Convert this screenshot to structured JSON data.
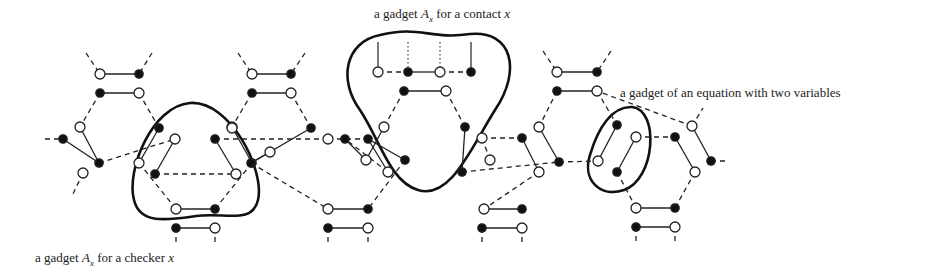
{
  "labels": {
    "contact": {
      "prefix": "a gadget ",
      "sym": "A",
      "sub": "x",
      "mid": " for a contact ",
      "var": "x",
      "x": 374,
      "y": 6
    },
    "equation": {
      "text": "a gadget of an equation with two variables",
      "x": 620,
      "y": 85
    },
    "checker": {
      "prefix": "a gadget ",
      "sym": "A",
      "sub": "x",
      "mid": " for a checker ",
      "var": "x",
      "x": 35,
      "y": 250
    }
  },
  "colors": {
    "stroke": "#222222",
    "node_fill_dark": "#111111",
    "node_fill_light": "#ffffff",
    "loop": "#111111"
  },
  "nodes": [
    {
      "id": "a1",
      "x": 100,
      "y": 74,
      "f": 0
    },
    {
      "id": "a2",
      "x": 139,
      "y": 74,
      "f": 1
    },
    {
      "id": "a3",
      "x": 100,
      "y": 93,
      "f": 1
    },
    {
      "id": "a4",
      "x": 139,
      "y": 93,
      "f": 0
    },
    {
      "id": "b1",
      "x": 252,
      "y": 74,
      "f": 0
    },
    {
      "id": "b2",
      "x": 291,
      "y": 74,
      "f": 1
    },
    {
      "id": "b3",
      "x": 252,
      "y": 93,
      "f": 1
    },
    {
      "id": "b4",
      "x": 291,
      "y": 93,
      "f": 0
    },
    {
      "id": "e1",
      "x": 557,
      "y": 72,
      "f": 0
    },
    {
      "id": "e2",
      "x": 597,
      "y": 72,
      "f": 1
    },
    {
      "id": "e3",
      "x": 557,
      "y": 91,
      "f": 1
    },
    {
      "id": "e4",
      "x": 597,
      "y": 91,
      "f": 0
    },
    {
      "id": "L1",
      "x": 63,
      "y": 139,
      "f": 1
    },
    {
      "id": "L2",
      "x": 80,
      "y": 127,
      "f": 0
    },
    {
      "id": "L3",
      "x": 99,
      "y": 163,
      "f": 1
    },
    {
      "id": "L4",
      "x": 83,
      "y": 173,
      "f": 0
    },
    {
      "id": "c1",
      "x": 159,
      "y": 128,
      "f": 1
    },
    {
      "id": "c2",
      "x": 175,
      "y": 139,
      "f": 0
    },
    {
      "id": "c3",
      "x": 215,
      "y": 139,
      "f": 1
    },
    {
      "id": "c4",
      "x": 232,
      "y": 127,
      "f": 0
    },
    {
      "id": "c5",
      "x": 139,
      "y": 163,
      "f": 0
    },
    {
      "id": "c6",
      "x": 155,
      "y": 174,
      "f": 1
    },
    {
      "id": "c7",
      "x": 236,
      "y": 174,
      "f": 0
    },
    {
      "id": "c8",
      "x": 252,
      "y": 163,
      "f": 1
    },
    {
      "id": "c9",
      "x": 176,
      "y": 209,
      "f": 0
    },
    {
      "id": "c10",
      "x": 215,
      "y": 209,
      "f": 1
    },
    {
      "id": "c11",
      "x": 176,
      "y": 228,
      "f": 1
    },
    {
      "id": "c12",
      "x": 215,
      "y": 228,
      "f": 0
    },
    {
      "id": "d1",
      "x": 232,
      "y": 128,
      "f": 0
    },
    {
      "id": "d2",
      "x": 311,
      "y": 128,
      "f": 1
    },
    {
      "id": "d3",
      "x": 328,
      "y": 139,
      "f": 0
    },
    {
      "id": "d4",
      "x": 368,
      "y": 139,
      "f": 1
    },
    {
      "id": "d5",
      "x": 251,
      "y": 163,
      "f": 1
    },
    {
      "id": "d6",
      "x": 270,
      "y": 152,
      "f": 0
    },
    {
      "id": "d7",
      "x": 405,
      "y": 160,
      "f": 1
    },
    {
      "id": "d8",
      "x": 388,
      "y": 172,
      "f": 0
    },
    {
      "id": "d9",
      "x": 328,
      "y": 209,
      "f": 0
    },
    {
      "id": "d10",
      "x": 368,
      "y": 209,
      "f": 1
    },
    {
      "id": "d11",
      "x": 328,
      "y": 228,
      "f": 1
    },
    {
      "id": "d12",
      "x": 368,
      "y": 228,
      "f": 0
    },
    {
      "id": "g1",
      "x": 378,
      "y": 72,
      "f": 0
    },
    {
      "id": "g2",
      "x": 408,
      "y": 72,
      "f": 1
    },
    {
      "id": "g3",
      "x": 440,
      "y": 72,
      "f": 0
    },
    {
      "id": "g4",
      "x": 471,
      "y": 72,
      "f": 1
    },
    {
      "id": "g5",
      "x": 404,
      "y": 91,
      "f": 1
    },
    {
      "id": "g6",
      "x": 446,
      "y": 91,
      "f": 0
    },
    {
      "id": "g7",
      "x": 384,
      "y": 127,
      "f": 0
    },
    {
      "id": "g8",
      "x": 465,
      "y": 127,
      "f": 1
    },
    {
      "id": "g9",
      "x": 345,
      "y": 139,
      "f": 1
    },
    {
      "id": "g10",
      "x": 366,
      "y": 160,
      "f": 0
    },
    {
      "id": "g11",
      "x": 490,
      "y": 160,
      "f": 0
    },
    {
      "id": "g12",
      "x": 462,
      "y": 172,
      "f": 1
    },
    {
      "id": "h1",
      "x": 482,
      "y": 138,
      "f": 0
    },
    {
      "id": "h2",
      "x": 522,
      "y": 138,
      "f": 1
    },
    {
      "id": "h3",
      "x": 539,
      "y": 127,
      "f": 0
    },
    {
      "id": "h4",
      "x": 559,
      "y": 162,
      "f": 1
    },
    {
      "id": "h5",
      "x": 539,
      "y": 172,
      "f": 0
    },
    {
      "id": "h6",
      "x": 484,
      "y": 209,
      "f": 0
    },
    {
      "id": "h7",
      "x": 522,
      "y": 209,
      "f": 1
    },
    {
      "id": "h8",
      "x": 482,
      "y": 228,
      "f": 1
    },
    {
      "id": "h9",
      "x": 522,
      "y": 228,
      "f": 0
    },
    {
      "id": "q1",
      "x": 617,
      "y": 125,
      "f": 1
    },
    {
      "id": "q2",
      "x": 636,
      "y": 137,
      "f": 0
    },
    {
      "id": "q3",
      "x": 598,
      "y": 161,
      "f": 0
    },
    {
      "id": "q4",
      "x": 617,
      "y": 172,
      "f": 1
    },
    {
      "id": "r1",
      "x": 675,
      "y": 137,
      "f": 1
    },
    {
      "id": "r2",
      "x": 692,
      "y": 126,
      "f": 0
    },
    {
      "id": "r3",
      "x": 711,
      "y": 161,
      "f": 1
    },
    {
      "id": "r4",
      "x": 695,
      "y": 172,
      "f": 0
    },
    {
      "id": "r5",
      "x": 636,
      "y": 208,
      "f": 0
    },
    {
      "id": "r6",
      "x": 675,
      "y": 208,
      "f": 1
    },
    {
      "id": "r7",
      "x": 636,
      "y": 227,
      "f": 1
    },
    {
      "id": "r8",
      "x": 675,
      "y": 227,
      "f": 0
    }
  ],
  "solid_edges": [
    [
      "a1",
      "a2"
    ],
    [
      "a3",
      "a4"
    ],
    [
      "b1",
      "b2"
    ],
    [
      "b3",
      "b4"
    ],
    [
      "e1",
      "e2"
    ],
    [
      "e3",
      "e4"
    ],
    [
      "L1",
      "L3"
    ],
    [
      "L2",
      "L3"
    ],
    [
      "c1",
      "c5"
    ],
    [
      "c2",
      "c6"
    ],
    [
      "c4",
      "c8"
    ],
    [
      "c3",
      "c7"
    ],
    [
      "c9",
      "c10"
    ],
    [
      "c11",
      "c12"
    ],
    [
      "d2",
      "d5"
    ],
    [
      "d6",
      "d5"
    ],
    [
      "d4",
      "d7"
    ],
    [
      "d4",
      "d8"
    ],
    [
      "d9",
      "d10"
    ],
    [
      "d11",
      "d12"
    ],
    [
      "g2",
      "g3"
    ],
    [
      "g5",
      "g6"
    ],
    [
      "g7",
      "g10"
    ],
    [
      "g8",
      "g12"
    ],
    [
      "g9",
      "g10"
    ],
    [
      "h3",
      "h4"
    ],
    [
      "h2",
      "h5"
    ],
    [
      "h6",
      "h7"
    ],
    [
      "h8",
      "h9"
    ],
    [
      "q1",
      "q3"
    ],
    [
      "q2",
      "q4"
    ],
    [
      "r1",
      "r4"
    ],
    [
      "r2",
      "r3"
    ],
    [
      "r5",
      "r6"
    ],
    [
      "r7",
      "r8"
    ]
  ],
  "dashed_edges": [
    [
      "a3",
      "L2"
    ],
    [
      "a4",
      "c1"
    ],
    [
      "b3",
      "c4"
    ],
    [
      "b4",
      "d2"
    ],
    [
      "L3",
      "c2"
    ],
    [
      "c3",
      "d3"
    ],
    [
      "c5",
      "c9"
    ],
    [
      "c8",
      "c10"
    ],
    [
      "d3",
      "d4"
    ],
    [
      "d5",
      "d9"
    ],
    [
      "d7",
      "d10"
    ],
    [
      "d8",
      "g9"
    ],
    [
      "g1",
      "g2"
    ],
    [
      "g3",
      "g4"
    ],
    [
      "g6",
      "g8"
    ],
    [
      "g5",
      "g7"
    ],
    [
      "g11",
      "h1"
    ],
    [
      "h1",
      "h2"
    ],
    [
      "e3",
      "h3"
    ],
    [
      "e4",
      "q1"
    ],
    [
      "h5",
      "h6"
    ],
    [
      "h4",
      "q3"
    ],
    [
      "q2",
      "r1"
    ],
    [
      "r2",
      "e4"
    ],
    [
      "q4",
      "r5"
    ],
    [
      "r4",
      "r6"
    ],
    [
      "c6",
      "c7"
    ],
    [
      "g12",
      "h4"
    ]
  ],
  "dangling_dashes": [
    [
      86,
      53,
      100,
      74
    ],
    [
      152,
      53,
      139,
      74
    ],
    [
      238,
      53,
      252,
      74
    ],
    [
      305,
      53,
      291,
      74
    ],
    [
      543,
      51,
      557,
      72
    ],
    [
      611,
      51,
      597,
      72
    ],
    [
      45,
      139,
      63,
      139
    ],
    [
      83,
      173,
      72,
      196
    ],
    [
      711,
      161,
      728,
      161
    ],
    [
      692,
      126,
      703,
      108
    ],
    [
      176,
      228,
      176,
      245
    ],
    [
      215,
      228,
      215,
      245
    ],
    [
      328,
      228,
      328,
      245
    ],
    [
      368,
      228,
      368,
      245
    ],
    [
      482,
      228,
      482,
      245
    ],
    [
      522,
      228,
      522,
      245
    ],
    [
      636,
      227,
      636,
      245
    ],
    [
      675,
      227,
      675,
      245
    ]
  ],
  "vertical_ticks": [
    [
      378,
      42,
      378,
      72
    ],
    [
      471,
      42,
      471,
      72
    ]
  ],
  "dotted_ticks": [
    [
      408,
      42,
      408,
      72
    ],
    [
      440,
      42,
      440,
      72
    ]
  ],
  "loops": [
    {
      "name": "checker-loop",
      "d": "M 190 103 C 230 100, 265 170, 258 200 C 252 225, 225 212, 196 216 C 168 220, 140 225, 134 200 C 126 170, 152 106, 190 103 Z"
    },
    {
      "name": "contact-loop",
      "d": "M 380 35 C 420 25, 430 40, 470 34 C 512 30, 522 70, 495 110 C 470 150, 450 200, 418 190 C 390 182, 380 140, 360 110 C 338 80, 345 42, 380 35 Z"
    },
    {
      "name": "equation-loop",
      "d": "M 632 107 C 660 110, 655 180, 624 190 C 600 198, 582 180, 590 155 C 598 128, 612 106, 632 107 Z"
    }
  ]
}
